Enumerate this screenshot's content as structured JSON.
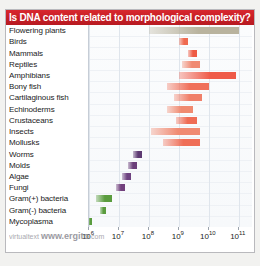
{
  "title": "Is DNA content related to morphological complexity?",
  "watermark": {
    "prefix": "virtualtext",
    "url": "www.ergito",
    "suffix": ".com"
  },
  "colors": {
    "title_bar": "#cc2027",
    "title_text": "#ffffff",
    "plot_bg": "#fdfdfe",
    "grid": "#dfe5ec",
    "plants": "#b9b39e",
    "vertebrates": "#ef5a48",
    "invertebrates": "#f07a63",
    "fungi": "#6b3f7a",
    "bacteria": "#5a9c3e"
  },
  "chart_data": {
    "type": "bar",
    "subtype": "horizontal-range",
    "title": "Is DNA content related to morphological complexity?",
    "xlabel": "",
    "ylabel": "",
    "xscale": "log",
    "xlim": [
      1000000,
      300000000000
    ],
    "grid": true,
    "legend": "none",
    "xticks": [
      {
        "value": 1000000,
        "label": "10",
        "exp": "6"
      },
      {
        "value": 10000000,
        "label": "10",
        "exp": "7"
      },
      {
        "value": 100000000,
        "label": "10",
        "exp": "8"
      },
      {
        "value": 1000000000,
        "label": "10",
        "exp": "9"
      },
      {
        "value": 10000000000,
        "label": "10",
        "exp": "10"
      },
      {
        "value": 100000000000,
        "label": "10",
        "exp": "11"
      }
    ],
    "categories": [
      "Flowering plants",
      "Birds",
      "Mammals",
      "Reptiles",
      "Amphibians",
      "Bony fish",
      "Cartilaginous fish",
      "Echinoderms",
      "Crustaceans",
      "Insects",
      "Mollusks",
      "Worms",
      "Molds",
      "Algae",
      "Fungi",
      "Gram(+) bacteria",
      "Gram(-) bacteria",
      "Mycoplasma"
    ],
    "ranges": [
      {
        "category": "Flowering plants",
        "min": 100000000,
        "max": 100000000000,
        "group": "plants",
        "color": "#b9b39e"
      },
      {
        "category": "Birds",
        "min": 1000000000,
        "max": 2000000000,
        "group": "vertebrates",
        "color": "#ef6a50"
      },
      {
        "category": "Mammals",
        "min": 2000000000,
        "max": 4000000000,
        "group": "vertebrates",
        "color": "#ee5a44"
      },
      {
        "category": "Reptiles",
        "min": 1300000000,
        "max": 5000000000,
        "group": "vertebrates",
        "color": "#f08a72"
      },
      {
        "category": "Amphibians",
        "min": 1000000000,
        "max": 80000000000,
        "group": "vertebrates",
        "color": "#ef5a48"
      },
      {
        "category": "Bony fish",
        "min": 400000000,
        "max": 10000000000,
        "group": "vertebrates",
        "color": "#f0705a"
      },
      {
        "category": "Cartilaginous fish",
        "min": 700000000,
        "max": 6000000000,
        "group": "vertebrates",
        "color": "#f0806a"
      },
      {
        "category": "Echinoderms",
        "min": 400000000,
        "max": 3000000000,
        "group": "invertebrates",
        "color": "#f08a70"
      },
      {
        "category": "Crustaceans",
        "min": 800000000,
        "max": 4000000000,
        "group": "invertebrates",
        "color": "#ef6c55"
      },
      {
        "category": "Insects",
        "min": 120000000,
        "max": 5000000000,
        "group": "invertebrates",
        "color": "#f08a72"
      },
      {
        "category": "Mollusks",
        "min": 300000000,
        "max": 5000000000,
        "group": "invertebrates",
        "color": "#ef6e57"
      },
      {
        "category": "Worms",
        "min": 30000000,
        "max": 60000000,
        "group": "fungi",
        "color": "#5d3a72"
      },
      {
        "category": "Molds",
        "min": 20000000,
        "max": 40000000,
        "group": "fungi",
        "color": "#6b3f7a"
      },
      {
        "category": "Algae",
        "min": 13000000,
        "max": 25000000,
        "group": "fungi",
        "color": "#6e4280"
      },
      {
        "category": "Fungi",
        "min": 8000000,
        "max": 16000000,
        "group": "fungi",
        "color": "#72407d"
      },
      {
        "category": "Gram(+) bacteria",
        "min": 1700000,
        "max": 6000000,
        "group": "bacteria",
        "color": "#5a9c3e"
      },
      {
        "category": "Gram(-) bacteria",
        "min": 2400000,
        "max": 3600000,
        "group": "bacteria",
        "color": "#5a9c3e"
      },
      {
        "category": "Mycoplasma",
        "min": 900000,
        "max": 1300000,
        "group": "bacteria",
        "color": "#5a9c3e"
      }
    ]
  }
}
